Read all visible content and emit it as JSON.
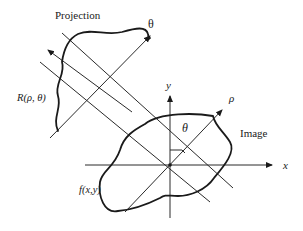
{
  "diagram": {
    "labels": {
      "projection": "Projection",
      "theta_top": "θ",
      "r_rho_theta": "R(ρ, θ)",
      "y_axis": "y",
      "rho": "ρ",
      "theta_inner": "θ",
      "image": "Image",
      "x_axis": "x",
      "fxy": "f(x,y)"
    },
    "colors": {
      "line": "#2a2a2a",
      "curve": "#1a1a1a",
      "background": "#ffffff"
    }
  }
}
